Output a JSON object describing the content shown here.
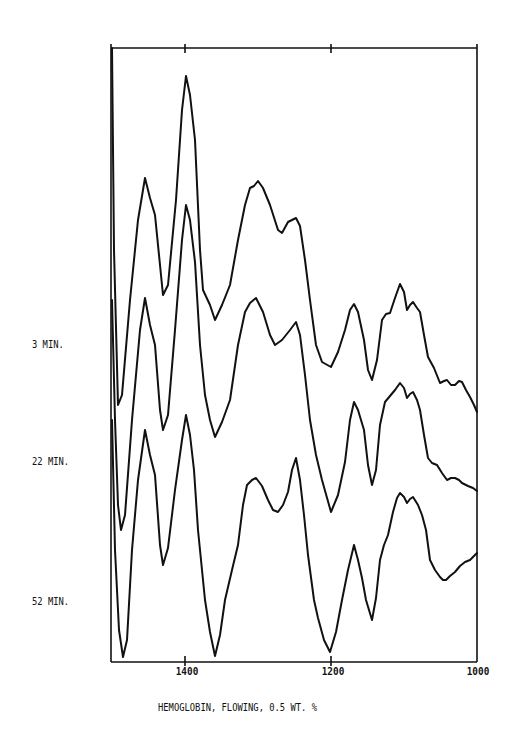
{
  "chart_data": {
    "type": "line",
    "title": "HEMOGLOBIN, FLOWING, 0.5 WT. %",
    "xlabel": "",
    "ylabel": "",
    "x_axis": {
      "reversed": true,
      "range": [
        1500,
        1000
      ],
      "ticks": [
        1400,
        1200,
        1000
      ],
      "tick_labels": [
        "1400",
        "1200",
        "1000"
      ]
    },
    "grid": false,
    "legend": "none (traces labeled at left)",
    "frame_px": {
      "left": 111,
      "right": 477,
      "top": 48,
      "bottom": 662
    },
    "series": [
      {
        "name": "3 MIN.",
        "label_y": 344,
        "points_px": [
          [
            112,
            48
          ],
          [
            114,
            250
          ],
          [
            118,
            405
          ],
          [
            122,
            395
          ],
          [
            130,
            300
          ],
          [
            138,
            220
          ],
          [
            145,
            178
          ],
          [
            150,
            198
          ],
          [
            155,
            215
          ],
          [
            163,
            295
          ],
          [
            168,
            285
          ],
          [
            176,
            200
          ],
          [
            182,
            110
          ],
          [
            186,
            76
          ],
          [
            190,
            95
          ],
          [
            195,
            140
          ],
          [
            200,
            250
          ],
          [
            203,
            290
          ],
          [
            210,
            305
          ],
          [
            215,
            320
          ],
          [
            222,
            305
          ],
          [
            230,
            285
          ],
          [
            238,
            240
          ],
          [
            245,
            205
          ],
          [
            250,
            188
          ],
          [
            254,
            186
          ],
          [
            258,
            181
          ],
          [
            263,
            188
          ],
          [
            270,
            205
          ],
          [
            278,
            230
          ],
          [
            282,
            233
          ],
          [
            288,
            222
          ],
          [
            296,
            218
          ],
          [
            300,
            226
          ],
          [
            305,
            260
          ],
          [
            310,
            300
          ],
          [
            316,
            345
          ],
          [
            322,
            362
          ],
          [
            331,
            367
          ],
          [
            338,
            352
          ],
          [
            345,
            330
          ],
          [
            350,
            310
          ],
          [
            354,
            304
          ],
          [
            358,
            312
          ],
          [
            364,
            340
          ],
          [
            368,
            370
          ],
          [
            372,
            380
          ],
          [
            377,
            360
          ],
          [
            382,
            320
          ],
          [
            386,
            314
          ],
          [
            390,
            313
          ],
          [
            395,
            298
          ],
          [
            400,
            284
          ],
          [
            404,
            292
          ],
          [
            407,
            310
          ],
          [
            410,
            305
          ],
          [
            413,
            302
          ],
          [
            417,
            308
          ],
          [
            420,
            312
          ],
          [
            424,
            335
          ],
          [
            428,
            357
          ],
          [
            434,
            368
          ],
          [
            440,
            383
          ],
          [
            444,
            381
          ],
          [
            447,
            380
          ],
          [
            451,
            385
          ],
          [
            455,
            385
          ],
          [
            459,
            381
          ],
          [
            462,
            382
          ],
          [
            466,
            390
          ],
          [
            470,
            397
          ],
          [
            474,
            405
          ],
          [
            477,
            412
          ]
        ]
      },
      {
        "name": "22 MIN.",
        "label_y": 461,
        "points_px": [
          [
            112,
            300
          ],
          [
            115,
            420
          ],
          [
            118,
            505
          ],
          [
            121,
            530
          ],
          [
            125,
            515
          ],
          [
            132,
            420
          ],
          [
            140,
            330
          ],
          [
            145,
            298
          ],
          [
            150,
            325
          ],
          [
            155,
            345
          ],
          [
            160,
            410
          ],
          [
            163,
            430
          ],
          [
            168,
            415
          ],
          [
            175,
            330
          ],
          [
            182,
            240
          ],
          [
            186,
            205
          ],
          [
            190,
            220
          ],
          [
            195,
            262
          ],
          [
            200,
            345
          ],
          [
            205,
            395
          ],
          [
            210,
            420
          ],
          [
            215,
            437
          ],
          [
            222,
            422
          ],
          [
            230,
            400
          ],
          [
            238,
            345
          ],
          [
            245,
            312
          ],
          [
            250,
            303
          ],
          [
            256,
            298
          ],
          [
            263,
            312
          ],
          [
            270,
            335
          ],
          [
            275,
            345
          ],
          [
            282,
            340
          ],
          [
            290,
            330
          ],
          [
            296,
            322
          ],
          [
            300,
            335
          ],
          [
            305,
            375
          ],
          [
            310,
            420
          ],
          [
            316,
            455
          ],
          [
            322,
            480
          ],
          [
            331,
            512
          ],
          [
            338,
            495
          ],
          [
            345,
            462
          ],
          [
            350,
            420
          ],
          [
            354,
            402
          ],
          [
            358,
            410
          ],
          [
            364,
            430
          ],
          [
            368,
            465
          ],
          [
            372,
            485
          ],
          [
            376,
            470
          ],
          [
            380,
            425
          ],
          [
            385,
            402
          ],
          [
            390,
            396
          ],
          [
            395,
            390
          ],
          [
            400,
            383
          ],
          [
            404,
            388
          ],
          [
            407,
            398
          ],
          [
            410,
            394
          ],
          [
            413,
            392
          ],
          [
            417,
            400
          ],
          [
            420,
            410
          ],
          [
            424,
            435
          ],
          [
            428,
            458
          ],
          [
            432,
            463
          ],
          [
            437,
            465
          ],
          [
            442,
            473
          ],
          [
            447,
            480
          ],
          [
            451,
            478
          ],
          [
            455,
            478
          ],
          [
            459,
            480
          ],
          [
            462,
            483
          ],
          [
            468,
            486
          ],
          [
            473,
            488
          ],
          [
            477,
            491
          ]
        ]
      },
      {
        "name": "52 MIN.",
        "label_y": 601,
        "points_px": [
          [
            112,
            420
          ],
          [
            115,
            550
          ],
          [
            119,
            630
          ],
          [
            123,
            657
          ],
          [
            127,
            640
          ],
          [
            132,
            550
          ],
          [
            138,
            480
          ],
          [
            145,
            430
          ],
          [
            150,
            455
          ],
          [
            155,
            475
          ],
          [
            160,
            545
          ],
          [
            163,
            565
          ],
          [
            168,
            548
          ],
          [
            175,
            490
          ],
          [
            182,
            440
          ],
          [
            186,
            415
          ],
          [
            190,
            435
          ],
          [
            194,
            470
          ],
          [
            198,
            530
          ],
          [
            205,
            600
          ],
          [
            210,
            632
          ],
          [
            215,
            656
          ],
          [
            220,
            635
          ],
          [
            225,
            600
          ],
          [
            232,
            570
          ],
          [
            238,
            545
          ],
          [
            243,
            505
          ],
          [
            247,
            485
          ],
          [
            252,
            480
          ],
          [
            256,
            478
          ],
          [
            262,
            486
          ],
          [
            268,
            500
          ],
          [
            273,
            510
          ],
          [
            278,
            512
          ],
          [
            283,
            505
          ],
          [
            288,
            492
          ],
          [
            292,
            470
          ],
          [
            296,
            458
          ],
          [
            300,
            480
          ],
          [
            304,
            515
          ],
          [
            308,
            555
          ],
          [
            314,
            600
          ],
          [
            318,
            618
          ],
          [
            324,
            640
          ],
          [
            330,
            652
          ],
          [
            336,
            632
          ],
          [
            342,
            600
          ],
          [
            348,
            570
          ],
          [
            354,
            545
          ],
          [
            358,
            560
          ],
          [
            362,
            578
          ],
          [
            366,
            600
          ],
          [
            372,
            620
          ],
          [
            376,
            598
          ],
          [
            380,
            560
          ],
          [
            384,
            545
          ],
          [
            388,
            535
          ],
          [
            393,
            512
          ],
          [
            397,
            498
          ],
          [
            400,
            493
          ],
          [
            404,
            497
          ],
          [
            407,
            503
          ],
          [
            410,
            499
          ],
          [
            413,
            497
          ],
          [
            418,
            505
          ],
          [
            422,
            515
          ],
          [
            426,
            530
          ],
          [
            430,
            560
          ],
          [
            435,
            570
          ],
          [
            440,
            577
          ],
          [
            443,
            580
          ],
          [
            446,
            580
          ],
          [
            450,
            576
          ],
          [
            455,
            572
          ],
          [
            460,
            566
          ],
          [
            465,
            562
          ],
          [
            470,
            560
          ],
          [
            474,
            556
          ],
          [
            477,
            553
          ]
        ]
      }
    ]
  },
  "labels": {
    "trace_1": "3 MIN.",
    "trace_2": "22 MIN.",
    "trace_3": "52 MIN.",
    "tick_1400": "1400",
    "tick_1200": "1200",
    "tick_1000": "1000",
    "caption": "HEMOGLOBIN, FLOWING, 0.5 WT. %"
  }
}
